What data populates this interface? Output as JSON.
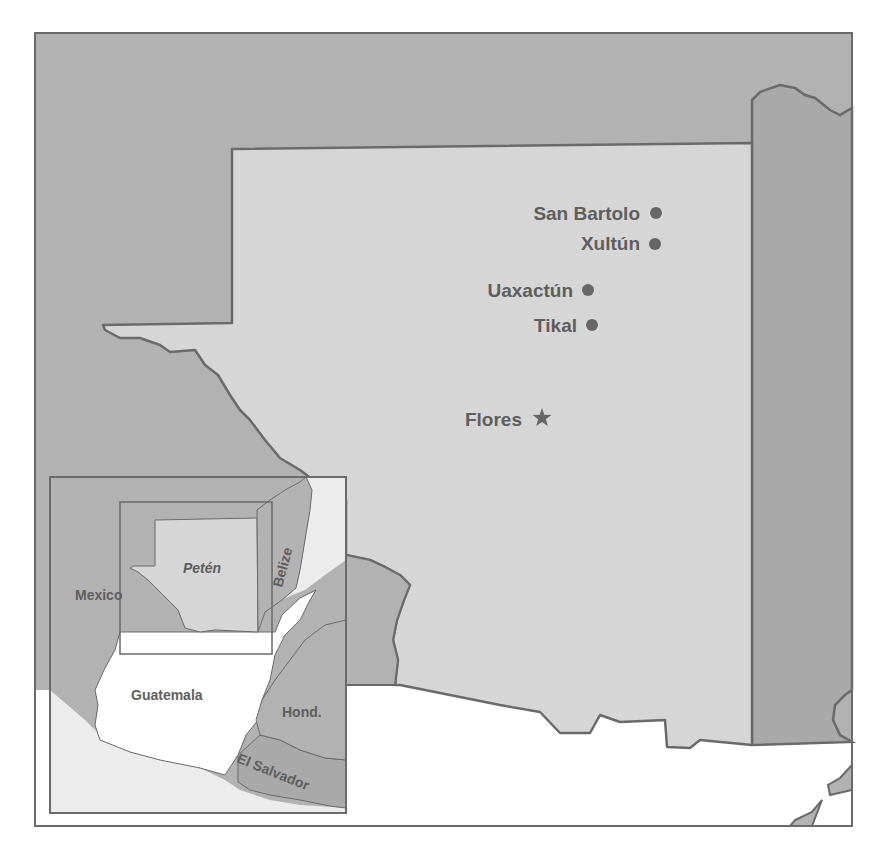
{
  "colors": {
    "background": "#ffffff",
    "neighbor_land": "#b2b2b2",
    "peten_land": "#d6d6d6",
    "ocean_inset": "#ececec",
    "guatemala_inset": "#ffffff",
    "border": "#6a6a6a",
    "label": "#5e5e5e",
    "marker": "#666666"
  },
  "sites": [
    {
      "name": "San Bartolo",
      "type": "circle",
      "label_x": 640,
      "label_y": 220,
      "mark_x": 656,
      "mark_y": 213
    },
    {
      "name": "Xultún",
      "type": "circle",
      "label_x": 640,
      "label_y": 250,
      "mark_x": 655,
      "mark_y": 244
    },
    {
      "name": "Uaxactún",
      "type": "circle",
      "label_x": 573,
      "label_y": 297,
      "mark_x": 588,
      "mark_y": 290
    },
    {
      "name": "Tikal",
      "type": "circle",
      "label_x": 577,
      "label_y": 332,
      "mark_x": 592,
      "mark_y": 325
    },
    {
      "name": "Flores",
      "type": "star",
      "label_x": 522,
      "label_y": 426,
      "mark_x": 542,
      "mark_y": 418
    }
  ],
  "inset": {
    "labels": {
      "mexico": "Mexico",
      "peten": "Petén",
      "belize": "Belize",
      "guatemala": "Guatemala",
      "honduras": "Hond.",
      "el_salvador": "El Salvador"
    }
  }
}
